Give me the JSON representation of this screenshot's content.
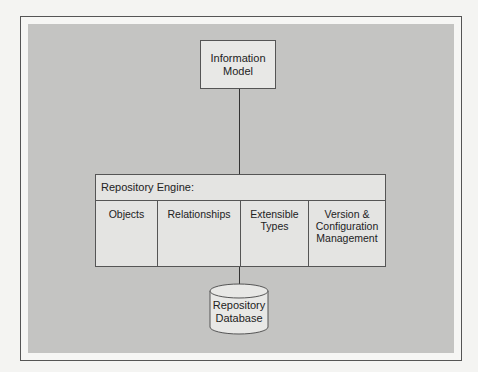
{
  "diagram": {
    "nodes": {
      "information_model": {
        "label": "Information\nModel"
      },
      "repository_engine": {
        "title": "Repository Engine:",
        "components": [
          {
            "label": "Objects"
          },
          {
            "label": "Relationships"
          },
          {
            "label": "Extensible\nTypes"
          },
          {
            "label": "Version &\nConfiguration\nManagement"
          }
        ]
      },
      "repository_database": {
        "label": "Repository\nDatabase"
      }
    },
    "edges": [
      {
        "from": "information_model",
        "to": "repository_engine"
      },
      {
        "from": "repository_engine",
        "to": "repository_database"
      }
    ],
    "colors": {
      "panel_background": "#c4c4c2",
      "box_fill": "#e8e8e6",
      "stroke": "#555555"
    }
  }
}
